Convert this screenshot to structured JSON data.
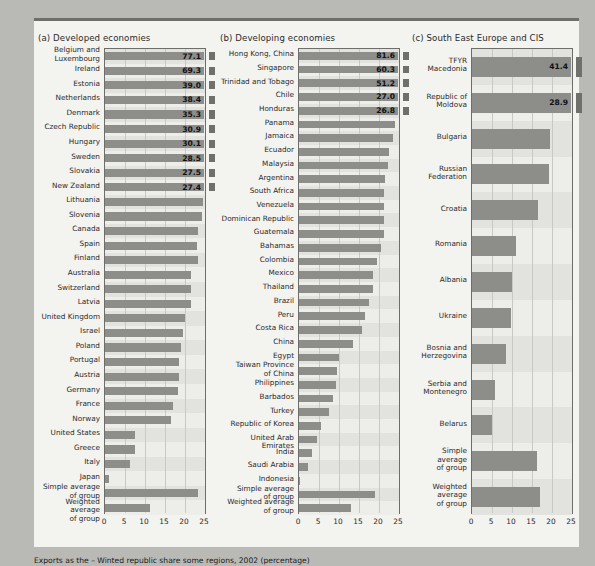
{
  "figure": {
    "footnote": "Exports as the – Winted republic share some regions, 2002 (percentage)",
    "axis_ticks": [
      "0",
      "5",
      "10",
      "15",
      "20",
      "25"
    ],
    "axis_min": 0,
    "axis_max": 25,
    "bar_color": "#8d8d8a",
    "band_color": "#e2e2de",
    "frame_color": "#6d6d6a",
    "card_color": "#f3f3f0",
    "page_color": "#b9b9b5"
  },
  "chart_data": [
    {
      "type": "bar",
      "title": "(a) Developed economies",
      "orientation": "horizontal",
      "xlabel": "",
      "ylabel": "",
      "xlim": [
        0,
        25
      ],
      "grid": true,
      "legend": "none",
      "categories": [
        "Belgium and\nLuxembourg",
        "Ireland",
        "Estonia",
        "Netherlands",
        "Denmark",
        "Czech Republic",
        "Hungary",
        "Sweden",
        "Slovakia",
        "New Zealand",
        "Lithuania",
        "Slovenia",
        "Canada",
        "Spain",
        "Finland",
        "Australia",
        "Switzerland",
        "Latvia",
        "United Kingdom",
        "Israel",
        "Poland",
        "Portugal",
        "Austria",
        "Germany",
        "France",
        "Norway",
        "United States",
        "Greece",
        "Italy",
        "Japan",
        "Simple average\nof group",
        "Weighted average\nof group"
      ],
      "values": [
        77.1,
        69.3,
        39.0,
        38.4,
        35.3,
        30.9,
        30.1,
        28.5,
        27.5,
        27.4,
        24.5,
        24.2,
        23.3,
        23.1,
        23.2,
        21.5,
        21.4,
        21.6,
        19.9,
        19.5,
        19.1,
        18.5,
        18.4,
        18.2,
        16.9,
        16.4,
        7.6,
        7.4,
        6.3,
        1.0,
        23.2,
        11.3
      ],
      "value_labels": [
        "77.1",
        "69.3",
        "39.0",
        "38.4",
        "35.3",
        "30.9",
        "30.1",
        "28.5",
        "27.5",
        "27.4",
        "",
        "",
        "",
        "",
        "",
        "",
        "",
        "",
        "",
        "",
        "",
        "",
        "",
        "",
        "",
        "",
        "",
        "",
        "",
        "",
        "",
        ""
      ],
      "truncated_flags": [
        true,
        true,
        true,
        true,
        true,
        true,
        true,
        true,
        true,
        true,
        false,
        false,
        false,
        false,
        false,
        false,
        false,
        false,
        false,
        false,
        false,
        false,
        false,
        false,
        false,
        false,
        false,
        false,
        false,
        false,
        false,
        false
      ]
    },
    {
      "type": "bar",
      "title": "(b) Developing economies",
      "orientation": "horizontal",
      "xlabel": "",
      "ylabel": "",
      "xlim": [
        0,
        25
      ],
      "grid": true,
      "legend": "none",
      "categories": [
        "Hong Kong, China",
        "Singapore",
        "Trinidad and Tobago",
        "Chile",
        "Honduras",
        "Panama",
        "Jamaica",
        "Ecuador",
        "Malaysia",
        "Argentina",
        "South Africa",
        "Venezuela",
        "Dominican Republic",
        "Guatemala",
        "Bahamas",
        "Colombia",
        "Mexico",
        "Thailand",
        "Brazil",
        "Peru",
        "Costa Rica",
        "China",
        "Egypt",
        "Taiwan Province\nof China",
        "Philippines",
        "Barbados",
        "Turkey",
        "Republic of Korea",
        "United Arab Emirates",
        "India",
        "Saudi Arabia",
        "Indonesia",
        "Simple average\nof group",
        "Weighted average\nof group"
      ],
      "values": [
        81.6,
        60.3,
        51.2,
        27.0,
        26.8,
        23.9,
        23.6,
        22.6,
        22.2,
        21.6,
        21.2,
        21.2,
        21.2,
        21.2,
        20.4,
        19.6,
        18.5,
        18.4,
        17.6,
        16.4,
        15.8,
        13.5,
        9.9,
        9.5,
        9.3,
        8.5,
        7.5,
        5.5,
        4.5,
        3.2,
        2.3,
        0.3,
        19.0,
        13.0
      ],
      "value_labels": [
        "81.6",
        "60.3",
        "51.2",
        "27.0",
        "26.8",
        "",
        "",
        "",
        "",
        "",
        "",
        "",
        "",
        "",
        "",
        "",
        "",
        "",
        "",
        "",
        "",
        "",
        "",
        "",
        "",
        "",
        "",
        "",
        "",
        "",
        "",
        "",
        "",
        ""
      ],
      "truncated_flags": [
        true,
        true,
        true,
        true,
        true,
        false,
        false,
        false,
        false,
        false,
        false,
        false,
        false,
        false,
        false,
        false,
        false,
        false,
        false,
        false,
        false,
        false,
        false,
        false,
        false,
        false,
        false,
        false,
        false,
        false,
        false,
        false,
        false,
        false
      ]
    },
    {
      "type": "bar",
      "title": "(c) South East Europe and CIS",
      "orientation": "horizontal",
      "xlabel": "",
      "ylabel": "",
      "xlim": [
        0,
        25
      ],
      "grid": true,
      "legend": "none",
      "categories": [
        "TFYR\nMacedonia",
        "Republic of\nMoldova",
        "Bulgaria",
        "Russian\nFederation",
        "Croatia",
        "Romania",
        "Albania",
        "Ukraine",
        "Bosnia and\nHerzegovina",
        "Serbia and\nMontenegro",
        "Belarus",
        "Simple\naverage\nof group",
        "Weighted\naverage\nof group"
      ],
      "values": [
        41.4,
        28.9,
        19.5,
        19.2,
        16.4,
        11.0,
        10.0,
        9.8,
        8.6,
        5.7,
        5.0,
        16.3,
        17.0
      ],
      "value_labels": [
        "41.4",
        "28.9",
        "",
        "",
        "",
        "",
        "",
        "",
        "",
        "",
        "",
        "",
        ""
      ],
      "truncated_flags": [
        true,
        true,
        false,
        false,
        false,
        false,
        false,
        false,
        false,
        false,
        false,
        false,
        false
      ]
    }
  ]
}
